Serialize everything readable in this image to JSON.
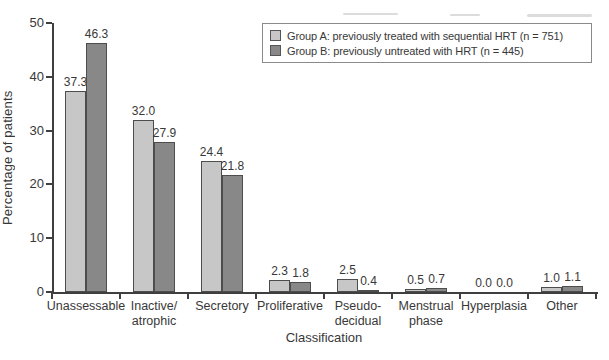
{
  "chart_data": {
    "type": "bar",
    "title": "",
    "xlabel": "Classification",
    "ylabel": "Percentage of patients",
    "ylim": [
      0,
      50
    ],
    "yticks": [
      0,
      10,
      20,
      30,
      40,
      50
    ],
    "grid": false,
    "legend_position": "top-right",
    "value_labels": true,
    "value_label_format": "one-decimal",
    "categories": [
      "Unassessable",
      "Inactive/\natrophic",
      "Secretory",
      "Proliferative",
      "Pseudo-\ndecidual",
      "Menstrual\nphase",
      "Hyperplasia",
      "Other"
    ],
    "series": [
      {
        "name": "Group A: previously treated with sequential HRT (n = 751)",
        "color": "#c7c7c7",
        "values": [
          37.3,
          32.0,
          24.4,
          2.3,
          2.5,
          0.5,
          0.0,
          1.0
        ]
      },
      {
        "name": "Group B: previously untreated with HRT (n = 445)",
        "color": "#888888",
        "values": [
          46.3,
          27.9,
          21.8,
          1.8,
          0.4,
          0.7,
          0.0,
          1.1
        ]
      }
    ],
    "colors": {
      "axis": "#3f3f3f",
      "text": "#383838",
      "bar_outline": "#4d4d4d",
      "legend_border": "#8a8a8a"
    }
  }
}
